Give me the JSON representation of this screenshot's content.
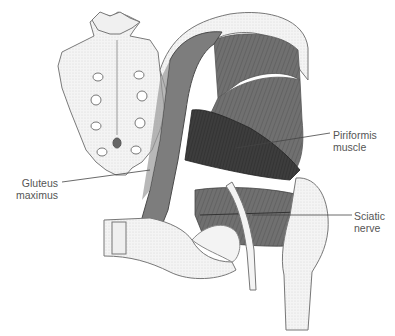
{
  "figure": {
    "labels": [
      {
        "id": "piriformis",
        "lines": [
          "Piriformis",
          "muscle"
        ]
      },
      {
        "id": "gluteus",
        "lines": [
          "Gluteus",
          "maximus"
        ]
      },
      {
        "id": "sciatic",
        "lines": [
          "Sciatic",
          "nerve"
        ]
      }
    ]
  },
  "colors": {
    "background": "#ffffff",
    "muscle_dark": "#3a3a3a",
    "muscle_mid": "#6e6e6e",
    "muscle_light": "#8f8f8f",
    "bone": "#f2f2f2",
    "bone_outline": "#7a7a7a",
    "label_text": "#555555",
    "leader_line": "#444444"
  }
}
